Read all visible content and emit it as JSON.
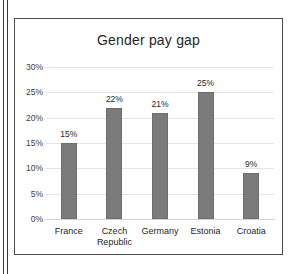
{
  "page": {
    "background_color": "#ffffff",
    "margin_rule_color": "#3a3a3a"
  },
  "chart_panel": {
    "border_color": "#4a4a4a",
    "background_color": "#ffffff"
  },
  "chart_data": {
    "type": "bar",
    "title": "Gender pay gap",
    "xlabel": "",
    "ylabel": "",
    "categories": [
      "France",
      "Czech Republic",
      "Germany",
      "Estonia",
      "Croatia"
    ],
    "category_lines": [
      [
        "France"
      ],
      [
        "Czech",
        "Republic"
      ],
      [
        "Germany"
      ],
      [
        "Estonia"
      ],
      [
        "Croatia"
      ]
    ],
    "values": [
      15,
      22,
      21,
      25,
      9
    ],
    "data_labels": [
      "15%",
      "22%",
      "21%",
      "25%",
      "9%"
    ],
    "ylim": [
      0,
      30
    ],
    "ytick_values": [
      30,
      25,
      20,
      15,
      10,
      5,
      0
    ],
    "ytick_labels": [
      "30%",
      "25%",
      "20%",
      "15%",
      "10%",
      "5%",
      "0%"
    ],
    "grid": true,
    "gridline_color": "#e4e4e4",
    "legend": false,
    "legend_position": "none",
    "bar_color": "#7b7b7b",
    "bar_border_color": "#6e6e6e",
    "value_unit": "%"
  }
}
